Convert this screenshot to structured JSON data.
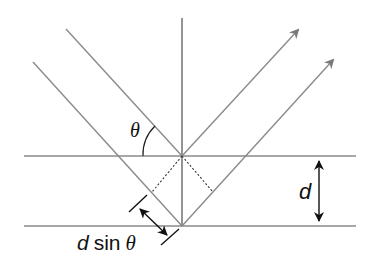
{
  "diagram": {
    "type": "bragg-diffraction",
    "labels": {
      "theta": "θ",
      "d": "d",
      "dsin_d": "d",
      "dsin_sin": "sin",
      "dsin_theta": "θ"
    },
    "colors": {
      "line": "#8a8a8a",
      "arrow": "#111111",
      "text": "#111111"
    }
  }
}
